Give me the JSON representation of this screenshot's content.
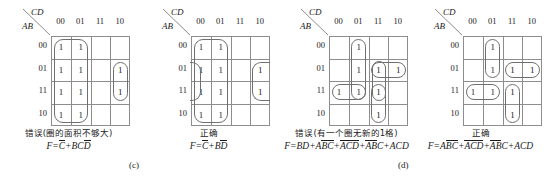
{
  "figure": {
    "subfigures": [
      {
        "label": "(c)"
      },
      {
        "label": "(d)"
      }
    ]
  },
  "axis_labels": {
    "cd": "CD",
    "ab": "AB",
    "columns": [
      "00",
      "01",
      "11",
      "10"
    ],
    "rows": [
      "00",
      "01",
      "11",
      "10"
    ]
  },
  "maps": [
    {
      "id": "kmap-c-wrong",
      "caption": "错误(圈的面积不够大)",
      "formula_parts": [
        {
          "t": "F",
          "bar": false
        },
        {
          "t": "=",
          "bar": false
        },
        {
          "t": "C",
          "bar": true
        },
        {
          "t": "+",
          "bar": false
        },
        {
          "t": "BC",
          "bar": false
        },
        {
          "t": "D",
          "bar": true
        }
      ],
      "formula_plain": "F=C̅+BCD̅",
      "cells": [
        [
          "1",
          "1",
          "",
          ""
        ],
        [
          "1",
          "1",
          "",
          "1"
        ],
        [
          "1",
          "1",
          "",
          "1"
        ],
        [
          "1",
          "1",
          "",
          ""
        ]
      ]
    },
    {
      "id": "kmap-c-correct",
      "caption": "正确",
      "formula_parts": [
        {
          "t": "F",
          "bar": false
        },
        {
          "t": "=",
          "bar": false
        },
        {
          "t": "C",
          "bar": true
        },
        {
          "t": "+",
          "bar": false
        },
        {
          "t": "B",
          "bar": false
        },
        {
          "t": "D",
          "bar": true
        }
      ],
      "formula_plain": "F=C̅+BD̅",
      "cells": [
        [
          "1",
          "1",
          "",
          ""
        ],
        [
          "1",
          "1",
          "",
          "1"
        ],
        [
          "1",
          "1",
          "",
          "1"
        ],
        [
          "1",
          "1",
          "",
          ""
        ]
      ]
    },
    {
      "id": "kmap-d-wrong",
      "caption": "错误(有一个圈无新的1格)",
      "formula_parts": [
        {
          "t": "F",
          "bar": false
        },
        {
          "t": "=",
          "bar": false
        },
        {
          "t": "BD",
          "bar": false
        },
        {
          "t": "+",
          "bar": false
        },
        {
          "t": "A",
          "bar": false
        },
        {
          "t": "BC",
          "bar": true
        },
        {
          "t": "+",
          "bar": false
        },
        {
          "t": "ACD",
          "bar": true
        },
        {
          "t": "+",
          "bar": false
        },
        {
          "t": "AB",
          "bar": true
        },
        {
          "t": "C",
          "bar": false
        },
        {
          "t": "+",
          "bar": false
        },
        {
          "t": "ACD",
          "bar": false
        }
      ],
      "formula_plain": "F=BD+ABC̅+ACD̅+AB̅C+ACD",
      "cells": [
        [
          "",
          "1",
          "",
          ""
        ],
        [
          "",
          "1",
          "1",
          "1"
        ],
        [
          "1",
          "1",
          "1",
          ""
        ],
        [
          "",
          "",
          "1",
          ""
        ]
      ]
    },
    {
      "id": "kmap-d-correct",
      "caption": "正确",
      "formula_parts": [
        {
          "t": "F",
          "bar": false
        },
        {
          "t": "=",
          "bar": false
        },
        {
          "t": "A",
          "bar": false
        },
        {
          "t": "BC",
          "bar": true
        },
        {
          "t": "+",
          "bar": false
        },
        {
          "t": "ACD",
          "bar": true
        },
        {
          "t": "+",
          "bar": false
        },
        {
          "t": "AB",
          "bar": true
        },
        {
          "t": "C",
          "bar": false
        },
        {
          "t": "+",
          "bar": false
        },
        {
          "t": "ACD",
          "bar": false
        }
      ],
      "formula_plain": "F=ABC̅+ACD̅+AB̅C+ACD",
      "cells": [
        [
          "",
          "1",
          "",
          ""
        ],
        [
          "",
          "1",
          "1",
          "1"
        ],
        [
          "1",
          "1",
          "1",
          ""
        ],
        [
          "",
          "",
          "1",
          ""
        ]
      ]
    }
  ]
}
